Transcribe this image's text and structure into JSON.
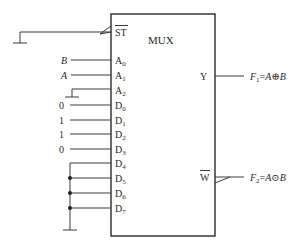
{
  "chip": {
    "title": "MUX",
    "enable_pin": "ST",
    "output_pin": "Y",
    "inverted_output_pin": "W"
  },
  "address_pins": [
    {
      "pin": "A",
      "sub": "0",
      "input": "B"
    },
    {
      "pin": "A",
      "sub": "1",
      "input": "A"
    },
    {
      "pin": "A",
      "sub": "2",
      "input": "ground"
    }
  ],
  "data_pins": [
    {
      "pin": "D",
      "sub": "0",
      "input": "0"
    },
    {
      "pin": "D",
      "sub": "1",
      "input": "1"
    },
    {
      "pin": "D",
      "sub": "2",
      "input": "1"
    },
    {
      "pin": "D",
      "sub": "3",
      "input": "0"
    },
    {
      "pin": "D",
      "sub": "4",
      "input": "ground-bus"
    },
    {
      "pin": "D",
      "sub": "5",
      "input": "ground-bus"
    },
    {
      "pin": "D",
      "sub": "6",
      "input": "ground-bus"
    },
    {
      "pin": "D",
      "sub": "7",
      "input": "ground-bus"
    }
  ],
  "outputs": {
    "f1": {
      "name": "F",
      "sub": "1",
      "expr_a": "A",
      "op": "⊕",
      "expr_b": "B"
    },
    "f2": {
      "name": "F",
      "sub": "2",
      "expr_a": "A",
      "op": "⊙",
      "expr_b": "B"
    }
  },
  "labels": {
    "in_B": "B",
    "in_A": "A",
    "d0": "0",
    "d1": "1",
    "d2": "1",
    "d3": "0",
    "eq": "="
  }
}
